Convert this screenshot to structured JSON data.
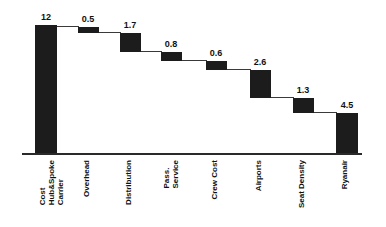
{
  "chart_data": {
    "type": "bar",
    "chart_subtype": "waterfall",
    "title": "",
    "subtitle": "",
    "xlabel": "",
    "ylabel": "",
    "grid": false,
    "legend": null,
    "axis": {
      "baseline_value": 0,
      "ylim": [
        0,
        12.6
      ],
      "show_y_axis": false,
      "show_x_axis": true
    },
    "categories": [
      "Cost Hub&Spoke Carrier",
      "Overhead",
      "Distribution",
      "Pass. Service",
      "Crew Cost",
      "Airports",
      "Seat Density",
      "Ryanair"
    ],
    "values": [
      12,
      0.5,
      1.7,
      0.8,
      0.6,
      2.6,
      1.3,
      4.5
    ],
    "data_labels": [
      "12",
      "0.5",
      "1.7",
      "0.8",
      "0.6",
      "2.6",
      "1.3",
      "4.5"
    ],
    "bar_kinds": [
      "total",
      "decrease",
      "decrease",
      "decrease",
      "decrease",
      "decrease",
      "decrease",
      "total"
    ],
    "running_totals": [
      12,
      11.5,
      9.8,
      9.0,
      8.4,
      5.8,
      4.5,
      4.5
    ],
    "bar_color": "#1c1c1c",
    "connector_color": "#3a3a3a",
    "axis_color": "#2a2a2a",
    "background_color": "#ffffff"
  },
  "bars": [
    {
      "name": "cost-hub-spoke-carrier",
      "label": "12",
      "label_lines": [
        "Cost",
        "Hub&Spoke",
        "Carrier"
      ],
      "x": 35,
      "width": 22,
      "top": 25,
      "height": 128,
      "label_x": 25,
      "label_y": 12,
      "label_w": 42,
      "cat_x": 38,
      "cat_y": 160
    },
    {
      "name": "overhead",
      "label": "0.5",
      "label_lines": [
        "Overhead"
      ],
      "x": 78,
      "width": 21,
      "top": 27,
      "height": 6,
      "label_x": 67,
      "label_y": 14,
      "label_w": 42,
      "cat_x": 82,
      "cat_y": 160
    },
    {
      "name": "distribution",
      "label": "1.7",
      "label_lines": [
        "Distribution"
      ],
      "x": 120,
      "width": 21,
      "top": 33,
      "height": 19,
      "label_x": 109,
      "label_y": 20,
      "label_w": 42,
      "cat_x": 124,
      "cat_y": 160
    },
    {
      "name": "pass-service",
      "label": "0.8",
      "label_lines": [
        "Pass.",
        "Service"
      ],
      "x": 161,
      "width": 21,
      "top": 52,
      "height": 9,
      "label_x": 150,
      "label_y": 39,
      "label_w": 42,
      "cat_x": 162,
      "cat_y": 160
    },
    {
      "name": "crew-cost",
      "label": "0.6",
      "label_lines": [
        "Crew Cost"
      ],
      "x": 206,
      "width": 21,
      "top": 61,
      "height": 9,
      "label_x": 195,
      "label_y": 48,
      "label_w": 42,
      "cat_x": 210,
      "cat_y": 160
    },
    {
      "name": "airports",
      "label": "2.6",
      "label_lines": [
        "Airports"
      ],
      "x": 250,
      "width": 21,
      "top": 70,
      "height": 28,
      "label_x": 239,
      "label_y": 57,
      "label_w": 42,
      "cat_x": 254,
      "cat_y": 160
    },
    {
      "name": "seat-density",
      "label": "1.3",
      "label_lines": [
        "Seat Density"
      ],
      "x": 293,
      "width": 21,
      "top": 98,
      "height": 15,
      "label_x": 282,
      "label_y": 85,
      "label_w": 42,
      "cat_x": 297,
      "cat_y": 160
    },
    {
      "name": "ryanair",
      "label": "4.5",
      "label_lines": [
        "Ryanair"
      ],
      "x": 336,
      "width": 22,
      "top": 113,
      "height": 40,
      "label_x": 326,
      "label_y": 100,
      "label_w": 42,
      "cat_x": 340,
      "cat_y": 160
    }
  ],
  "connectors": [
    {
      "name": "connector-1",
      "x": 56,
      "y": 26,
      "width": 23
    },
    {
      "name": "connector-2",
      "x": 98,
      "y": 32,
      "width": 23
    },
    {
      "name": "connector-3",
      "x": 140,
      "y": 51,
      "width": 22
    },
    {
      "name": "connector-4",
      "x": 181,
      "y": 60,
      "width": 26
    },
    {
      "name": "connector-5",
      "x": 226,
      "y": 69,
      "width": 25
    },
    {
      "name": "connector-6",
      "x": 270,
      "y": 97,
      "width": 24
    },
    {
      "name": "connector-7",
      "x": 313,
      "y": 112,
      "width": 24
    }
  ],
  "axis": {
    "baseline_x": 22,
    "baseline_y": 153,
    "baseline_width": 340
  }
}
